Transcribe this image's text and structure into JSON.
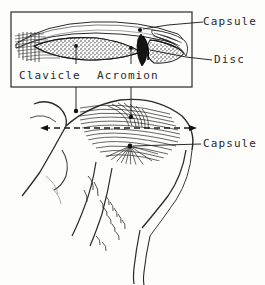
{
  "figure": {
    "background_color": "#fdfdfc",
    "ink_color": "#2a2a2a",
    "width": 265,
    "height": 285
  },
  "inset": {
    "name": "cross-section-inset",
    "box": {
      "x": 11,
      "y": 12,
      "width": 181,
      "height": 75
    },
    "border_color": "#3a3a3a",
    "description": "cross-sectional view of the acromioclavicular joint"
  },
  "labels": [
    {
      "id": "capsule-top",
      "text": "Capsule"
    },
    {
      "id": "disc",
      "text": "Disc"
    },
    {
      "id": "clavicle",
      "text": "Clavicle"
    },
    {
      "id": "acromion",
      "text": "Acromion"
    },
    {
      "id": "capsule-bottom",
      "text": "Capsule"
    }
  ],
  "leaders": [
    {
      "id": "capsule-top-leader",
      "from": [
        203,
        22
      ],
      "to": [
        140,
        30
      ]
    },
    {
      "id": "disc-leader",
      "from": [
        212,
        60
      ],
      "to": [
        168,
        52
      ]
    },
    {
      "id": "clavicle-leader",
      "from": [
        76,
        46
      ],
      "to": [
        76,
        110
      ]
    },
    {
      "id": "acromion-leader",
      "from": [
        131,
        48
      ],
      "to": [
        131,
        116
      ]
    },
    {
      "id": "capsule-bottom-leader",
      "from": [
        201,
        144
      ],
      "to": [
        130,
        146
      ]
    }
  ],
  "section_line": {
    "name": "joint-section-dashed-line",
    "y": 128,
    "x_start": 40,
    "x_end": 197,
    "style": "dashed-with-arrowheads"
  },
  "markers": [
    {
      "id": "capsule-top-dot",
      "x": 140,
      "y": 30
    },
    {
      "id": "clavicle-dot",
      "x": 76,
      "y": 46
    },
    {
      "id": "acromion-dot",
      "x": 131,
      "y": 48
    },
    {
      "id": "clavicle-body-dot",
      "x": 76,
      "y": 110
    },
    {
      "id": "acromion-body-dot",
      "x": 131,
      "y": 116
    },
    {
      "id": "capsule-body-dot",
      "x": 130,
      "y": 146
    }
  ]
}
